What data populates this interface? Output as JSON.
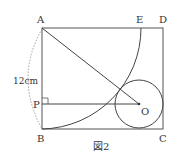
{
  "figure": {
    "caption": "図2",
    "points": {
      "A": "A",
      "B": "B",
      "C": "C",
      "D": "D",
      "E": "E",
      "P": "P",
      "O": "O"
    },
    "length_label": "12cm"
  },
  "colors": {
    "line": "#444444",
    "dashed": "#888888",
    "text": "#333333"
  }
}
